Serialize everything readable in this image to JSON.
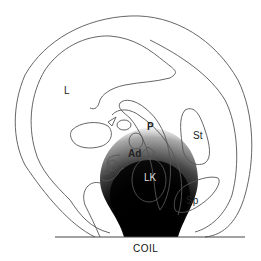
{
  "diagram": {
    "type": "anatomical-cross-section",
    "labels": {
      "liver": "L",
      "stomach": "St",
      "pancreas": "P",
      "adrenal": "Ad",
      "left_kidney": "LK",
      "spleen": "Sp",
      "coil": "COIL"
    },
    "colors": {
      "outline": "#555555",
      "signal_dark": "#000000",
      "signal_mid": "#777777",
      "background": "#ffffff"
    }
  }
}
